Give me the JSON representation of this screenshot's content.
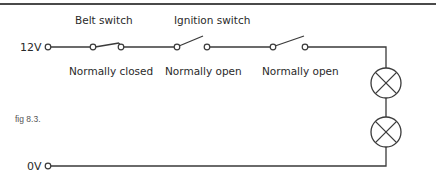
{
  "figure": {
    "caption": "fig 8.3."
  },
  "terminals": {
    "positive": "12V",
    "ground": "0V"
  },
  "switches": [
    {
      "title": "Belt switch",
      "state_label": "Normally closed"
    },
    {
      "title": "Ignition switch",
      "state_label": "Normally open"
    },
    {
      "title": "",
      "state_label": "Normally open"
    }
  ],
  "lamps": [
    {
      "id": "lamp-1"
    },
    {
      "id": "lamp-2"
    }
  ],
  "colors": {
    "wire": "#3a3a3a",
    "text": "#2a2a2a",
    "background": "#ffffff"
  }
}
